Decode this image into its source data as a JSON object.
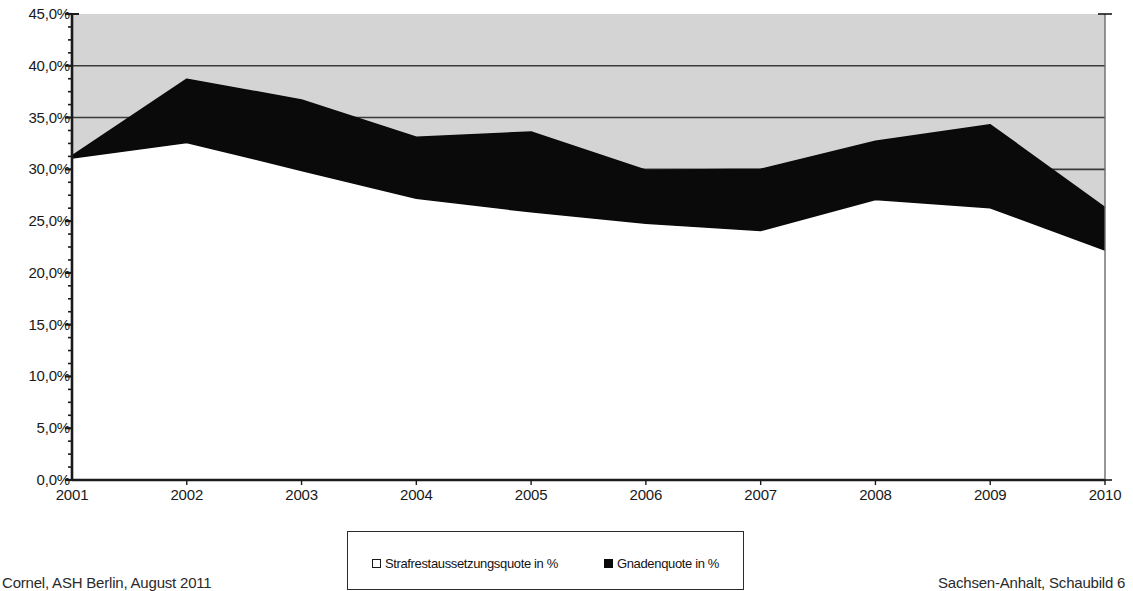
{
  "chart_data": {
    "type": "area",
    "stacked": true,
    "title": "",
    "subtitle": "",
    "xlabel": "",
    "ylabel": "",
    "categories": [
      "2001",
      "2002",
      "2003",
      "2004",
      "2005",
      "2006",
      "2007",
      "2008",
      "2009",
      "2010"
    ],
    "x": [
      2001,
      2002,
      2003,
      2004,
      2005,
      2006,
      2007,
      2008,
      2009,
      2010
    ],
    "series": [
      {
        "name": "Strafrestaussetzungsquote in %",
        "fill": "#ffffff",
        "values": [
          31.1,
          32.6,
          29.9,
          27.2,
          25.9,
          24.8,
          24.1,
          27.1,
          26.3,
          22.2
        ]
      },
      {
        "name": "Gnadenquote in %",
        "fill": "#0a0a0a",
        "values": [
          0.2,
          6.1,
          6.8,
          5.9,
          7.7,
          5.1,
          5.9,
          5.6,
          8.0,
          4.1
        ]
      }
    ],
    "cumulative_top": [
      31.3,
      38.7,
      36.7,
      33.1,
      33.6,
      29.9,
      30.0,
      32.7,
      34.3,
      26.3
    ],
    "ylim": [
      0,
      45
    ],
    "ytick_values": [
      0,
      5,
      10,
      15,
      20,
      25,
      30,
      35,
      40,
      45
    ],
    "ytick_labels": [
      "0,0%",
      "5,0%",
      "10,0%",
      "15,0%",
      "20,0%",
      "25,0%",
      "30,0%",
      "35,0%",
      "40,0%",
      "45,0%"
    ],
    "ytick_minor_step": 1.25,
    "gridlines": [
      30,
      35,
      40
    ],
    "grid": true,
    "plot_background": "#d4d4d4",
    "legend_position": "bottom"
  },
  "axis": {
    "y_labels": [
      "45,0%",
      "40,0%",
      "35,0%",
      "30,0%",
      "25,0%",
      "20,0%",
      "15,0%",
      "10,0%",
      "5,0%",
      "0,0%"
    ],
    "x_labels": [
      "2001",
      "2002",
      "2003",
      "2004",
      "2005",
      "2006",
      "2007",
      "2008",
      "2009",
      "2010"
    ]
  },
  "legend": {
    "entries": [
      {
        "label": "Strafrestaussetzungsquote in %",
        "marker": "hollow-square"
      },
      {
        "label": "Gnadenquote in %",
        "marker": "filled-square"
      }
    ]
  },
  "footer": {
    "left": "Cornel, ASH Berlin, August 2011",
    "right": "Sachsen-Anhalt, Schaubild 6"
  },
  "colors": {
    "plot_background": "#d4d4d4",
    "series_gnadenquote": "#0a0a0a",
    "series_strafrest": "#ffffff",
    "axis": "#1a1a1a",
    "gridline": "#3a3a3a"
  }
}
